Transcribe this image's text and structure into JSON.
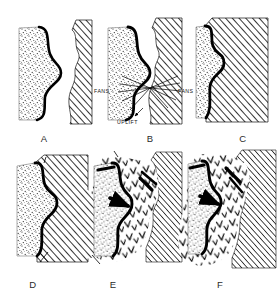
{
  "figure": {
    "title": "",
    "background_color": "#ffffff",
    "ink_color": "#000000",
    "panel_count": 6,
    "layout": {
      "rows": 2,
      "cols": 3
    }
  },
  "panels": [
    {
      "id": "A",
      "label": "A",
      "label_x": 44,
      "label_y": 141,
      "description": "Stippled sediment block with thick lobed contact on right; separate hatched basement block to the right with a gap between them",
      "units": [
        "stipple-sediment",
        "hatched-basement"
      ],
      "annotations": []
    },
    {
      "id": "B",
      "label": "B",
      "label_x": 150,
      "label_y": 141,
      "description": "Basement block uplifted and moving toward sediment; radiating arrows from the contact; alluvial fans shed both directions",
      "units": [
        "stipple-sediment",
        "hatched-basement"
      ],
      "annotations": [
        {
          "text": "FANS",
          "x": 97,
          "y": 91,
          "name": "fans-label-left"
        },
        {
          "text": "FANS",
          "x": 180,
          "y": 91,
          "name": "fans-label-right"
        },
        {
          "text": "UPLIFT",
          "x": 124,
          "y": 122,
          "name": "uplift-label"
        }
      ]
    },
    {
      "id": "C",
      "label": "C",
      "label_x": 243,
      "label_y": 141,
      "description": "Hatched basement block now in contact with the stippled sediment along the lobed thrust surface",
      "units": [
        "stipple-sediment",
        "hatched-basement"
      ],
      "annotations": []
    },
    {
      "id": "D",
      "label": "D",
      "label_x": 33,
      "label_y": 287,
      "description": "Full juxtaposition; basement overrides sediment along the thick lobed thrust contact",
      "units": [
        "stipple-sediment",
        "hatched-basement"
      ],
      "annotations": []
    },
    {
      "id": "E",
      "label": "E",
      "label_x": 113,
      "label_y": 287,
      "description": "Chevron (V-pattern) volcanic unit emplaced between the sediment and the hatched basement; thick thrust segments with arrowheads",
      "units": [
        "stipple-sediment",
        "chevron-volcanic",
        "hatched-basement"
      ],
      "annotations": []
    },
    {
      "id": "F",
      "label": "F",
      "label_x": 220,
      "label_y": 287,
      "description": "Chevron volcanic unit expanded and merged with the hatched basement; sediment wedge reduced at left",
      "units": [
        "stipple-sediment",
        "chevron-volcanic",
        "hatched-basement"
      ],
      "annotations": []
    }
  ],
  "legend_units": [
    {
      "key": "stipple-sediment",
      "pattern": "stipple",
      "name": "stippled sedimentary unit"
    },
    {
      "key": "hatched-basement",
      "pattern": "diagonal-hatch",
      "name": "hatched basement unit"
    },
    {
      "key": "chevron-volcanic",
      "pattern": "chevron-v",
      "name": "chevron volcanic unit"
    }
  ]
}
